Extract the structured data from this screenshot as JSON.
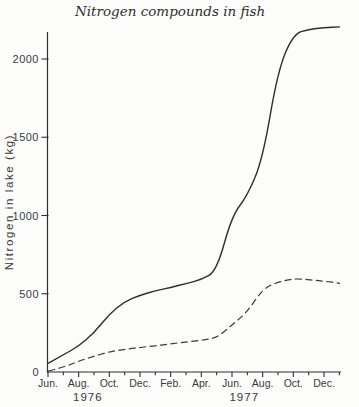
{
  "page": {
    "background": "#fcfcfa",
    "ink": "#2e2e2e",
    "text_color": "#3a3a3a"
  },
  "chart_data": {
    "type": "line",
    "title": "Nitrogen compounds in fish",
    "ylabel": "Nitrogen in lake (kg)",
    "xlabel": "",
    "ylim": [
      0,
      2250
    ],
    "y_ticks": [
      0,
      500,
      1000,
      1500,
      2000
    ],
    "x_tick_labels": [
      "Jun.",
      "Aug.",
      "Oct.",
      "Dec.",
      "Feb.",
      "Apr.",
      "Jun.",
      "Aug.",
      "Oct.",
      "Dec."
    ],
    "year_labels": [
      {
        "text": "1976",
        "month_index": 2.6
      },
      {
        "text": "1977",
        "month_index": 12.8
      }
    ],
    "months": [
      "Jun 1976",
      "Jul 1976",
      "Aug 1976",
      "Sep 1976",
      "Oct 1976",
      "Nov 1976",
      "Dec 1976",
      "Jan 1977",
      "Feb 1977",
      "Mar 1977",
      "Apr 1977",
      "May 1977",
      "Jun 1977",
      "Jul 1977",
      "Aug 1977",
      "Sep 1977",
      "Oct 1977",
      "Nov 1977",
      "Dec 1977"
    ],
    "grid": false,
    "legend": "none",
    "series": [
      {
        "name": "solid-line",
        "style": "solid",
        "color": "#2e2e2e",
        "values": [
          55,
          110,
          165,
          250,
          370,
          450,
          490,
          520,
          540,
          565,
          590,
          645,
          1000,
          1125,
          1360,
          1930,
          2160,
          2190,
          2200
        ],
        "end_value": 2205
      },
      {
        "name": "dashed-line",
        "style": "dashed",
        "color": "#3a3a3a",
        "values": [
          5,
          30,
          70,
          100,
          130,
          145,
          157,
          167,
          180,
          192,
          202,
          218,
          300,
          385,
          530,
          575,
          597,
          590,
          580
        ],
        "end_value": 567
      }
    ]
  }
}
